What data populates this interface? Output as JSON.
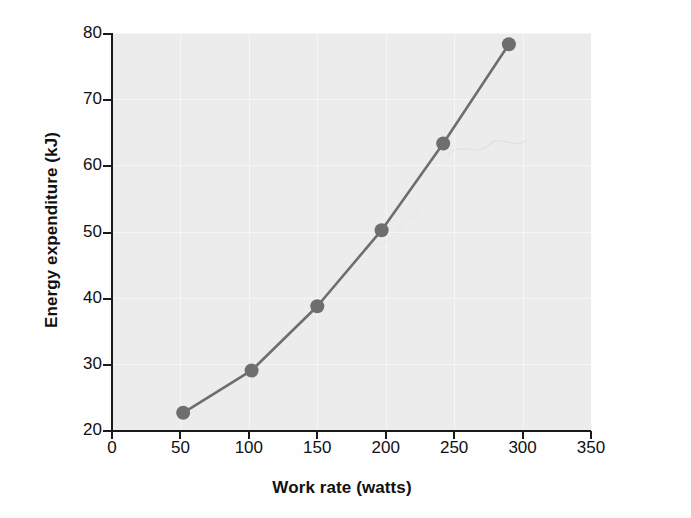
{
  "chart_data": {
    "type": "line",
    "title": "",
    "xlabel": "Work rate (watts)",
    "ylabel": "Energy expenditure (kJ)",
    "xlim": [
      0,
      350
    ],
    "ylim": [
      20,
      80
    ],
    "xticks": [
      0,
      50,
      100,
      150,
      200,
      250,
      300,
      350
    ],
    "xtick_labels": [
      "0",
      "50",
      "100",
      "150",
      "200",
      "250",
      "300",
      "350"
    ],
    "yticks": [
      20,
      30,
      40,
      50,
      60,
      70,
      80
    ],
    "ytick_labels": [
      "20",
      "30",
      "40",
      "50",
      "60",
      "70",
      "80"
    ],
    "grid": true,
    "legend": "none",
    "marker": "filled-circle",
    "marker_color": "#6e6e6e",
    "line_color": "#6e6e6e",
    "plot_background": "#ececec",
    "series": [
      {
        "name": "Energy expenditure",
        "x": [
          52,
          102,
          150,
          197,
          242,
          290
        ],
        "y": [
          22.6,
          29.0,
          38.7,
          50.2,
          63.3,
          78.3
        ]
      }
    ]
  },
  "axes": {
    "x_title": "Work rate (watts)",
    "y_title": "Energy expenditure (kJ)"
  }
}
